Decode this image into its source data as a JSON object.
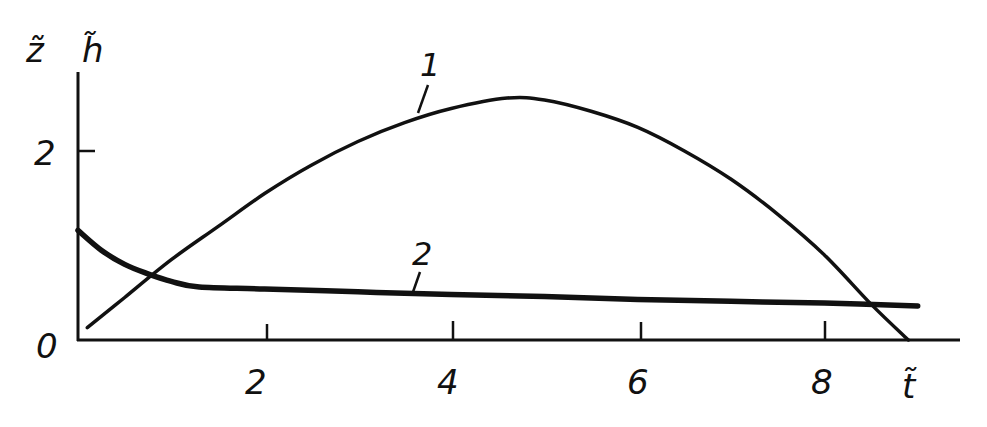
{
  "chart_data": {
    "type": "line",
    "title": "",
    "xlabel": "t̃",
    "ylabel": [
      "z̃",
      "h̃"
    ],
    "xlim": [
      0,
      9.5
    ],
    "ylim": [
      0,
      2.8
    ],
    "x_ticks": [
      2,
      4,
      6,
      8
    ],
    "y_ticks": [
      0,
      2
    ],
    "origin_label": "0",
    "grid": false,
    "legend": "inline curve numbers",
    "series": [
      {
        "name": "1",
        "x": [
          0.1,
          0.5,
          1.0,
          1.5,
          2.0,
          2.5,
          3.0,
          3.5,
          4.0,
          4.6,
          5.0,
          5.5,
          6.0,
          6.5,
          7.0,
          7.5,
          8.0,
          8.5,
          8.9
        ],
        "values": [
          0.13,
          0.45,
          0.85,
          1.2,
          1.55,
          1.85,
          2.1,
          2.3,
          2.45,
          2.56,
          2.54,
          2.42,
          2.25,
          2.0,
          1.7,
          1.33,
          0.9,
          0.38,
          0.0
        ]
      },
      {
        "name": "2",
        "x": [
          0.0,
          0.25,
          0.5,
          0.75,
          1.0,
          1.3,
          2.0,
          3.0,
          4.0,
          5.0,
          6.0,
          7.0,
          8.0,
          9.0
        ],
        "values": [
          1.16,
          0.95,
          0.8,
          0.7,
          0.62,
          0.56,
          0.54,
          0.51,
          0.48,
          0.46,
          0.43,
          0.41,
          0.39,
          0.36
        ]
      }
    ],
    "annotations": [
      {
        "text": "1",
        "x": 3.7,
        "y": 2.75
      },
      {
        "text": "2",
        "x": 3.6,
        "y": 0.85
      }
    ]
  },
  "labels": {
    "y_axis_z": "z̃",
    "y_axis_h": "h̃",
    "x_axis": "t̃",
    "origin": "0",
    "ytick_2": "2",
    "xtick_2": "2",
    "xtick_4": "4",
    "xtick_6": "6",
    "xtick_8": "8",
    "curve1": "1",
    "curve2": "2"
  }
}
